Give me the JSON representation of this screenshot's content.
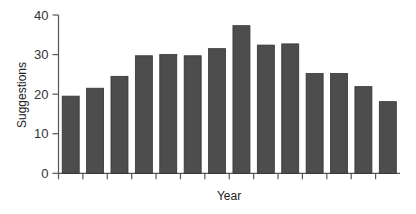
{
  "chart_data": {
    "type": "bar",
    "title": "",
    "xlabel": "Year",
    "ylabel": "Suggestions",
    "ylim": [
      0,
      40
    ],
    "yticks": [
      0,
      10,
      20,
      30,
      40
    ],
    "ytick_labels": [
      "0",
      "10",
      "20",
      "30",
      "40"
    ],
    "categories": [
      "1",
      "2",
      "3",
      "4",
      "5",
      "6",
      "7",
      "8",
      "9",
      "10",
      "11",
      "12",
      "13",
      "14"
    ],
    "xtick_labels_visible": false,
    "values": [
      19.5,
      21.5,
      24.5,
      29.7,
      30.0,
      29.7,
      31.5,
      37.3,
      32.4,
      32.7,
      25.2,
      25.2,
      21.9,
      18.1
    ],
    "grid": false,
    "legend": null,
    "colors": {
      "bar": "#4d4d4d",
      "bar_edge": "#333333",
      "axis": "#555555"
    }
  }
}
